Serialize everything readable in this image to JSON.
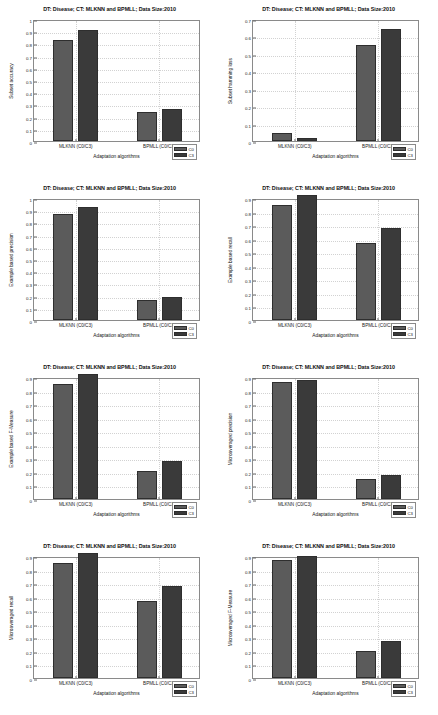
{
  "figure": {
    "shared_title": "DT: Disease; CT: MLKNN and BPMLL; Data Size:2010",
    "xlabel": "Adaptation algorithms",
    "categories": [
      "MLKNN (C0/C3)",
      "BPMLL (C0/C3)"
    ],
    "legend": [
      "C0",
      "C3"
    ],
    "colors": {
      "c0": "#5b5b5b",
      "c3": "#3a3a3a",
      "axis": "#8a8a8a",
      "grid": "#d2d2d2"
    }
  },
  "chart_data": [
    {
      "type": "bar",
      "title": "DT: Disease; CT: MLKNN and BPMLL; Data Size:2010",
      "xlabel": "Adaptation algorithms",
      "ylabel": "Subset accuracy",
      "categories": [
        "MLKNN (C0/C3)",
        "BPMLL (C0/C3)"
      ],
      "series": [
        {
          "name": "C0",
          "values": [
            0.83,
            0.24
          ]
        },
        {
          "name": "C3",
          "values": [
            0.91,
            0.26
          ]
        }
      ],
      "ylim": [
        0,
        1
      ],
      "yticks": [
        0,
        0.1,
        0.2,
        0.3,
        0.4,
        0.5,
        0.6,
        0.7,
        0.8,
        0.9,
        1
      ],
      "ytick_labels": [
        "0",
        "0.1",
        "0.2",
        "0.3",
        "0.4",
        "0.5",
        "0.6",
        "0.7",
        "0.8",
        "0.9",
        "1"
      ],
      "grid": true,
      "legend_position": "bottom-right"
    },
    {
      "type": "bar",
      "title": "DT: Disease; CT: MLKNN and BPMLL; Data Size:2010",
      "xlabel": "Adaptation algorithms",
      "ylabel": "Subset hamming loss",
      "categories": [
        "MLKNN (C0/C3)",
        "BPMLL (C0/C3)"
      ],
      "series": [
        {
          "name": "C0",
          "values": [
            0.045,
            0.55
          ]
        },
        {
          "name": "C3",
          "values": [
            0.015,
            0.64
          ]
        }
      ],
      "ylim": [
        0,
        0.7
      ],
      "yticks": [
        0,
        0.1,
        0.2,
        0.3,
        0.4,
        0.5,
        0.6,
        0.7
      ],
      "ytick_labels": [
        "0",
        "0.1",
        "0.2",
        "0.3",
        "0.4",
        "0.5",
        "0.6",
        "0.7"
      ],
      "grid": true,
      "legend_position": "bottom-right"
    },
    {
      "type": "bar",
      "title": "DT: Disease; CT: MLKNN and BPMLL; Data Size:2010",
      "xlabel": "Adaptation algorithms",
      "ylabel": "Example based precision",
      "categories": [
        "MLKNN (C0/C3)",
        "BPMLL (C0/C3)"
      ],
      "series": [
        {
          "name": "C0",
          "values": [
            0.87,
            0.16
          ]
        },
        {
          "name": "C3",
          "values": [
            0.93,
            0.19
          ]
        }
      ],
      "ylim": [
        0,
        1
      ],
      "yticks": [
        0,
        0.1,
        0.2,
        0.3,
        0.4,
        0.5,
        0.6,
        0.7,
        0.8,
        0.9,
        1
      ],
      "ytick_labels": [
        "0",
        "0.1",
        "0.2",
        "0.3",
        "0.4",
        "0.5",
        "0.6",
        "0.7",
        "0.8",
        "0.9",
        "1"
      ],
      "grid": true,
      "legend_position": "bottom-right"
    },
    {
      "type": "bar",
      "title": "DT: Disease; CT: MLKNN and BPMLL; Data Size:2010",
      "xlabel": "Adaptation algorithms",
      "ylabel": "Example based recall",
      "categories": [
        "MLKNN (C0/C3)",
        "BPMLL (C0/C3)"
      ],
      "series": [
        {
          "name": "C0",
          "values": [
            0.85,
            0.57
          ]
        },
        {
          "name": "C3",
          "values": [
            0.92,
            0.68
          ]
        }
      ],
      "ylim": [
        0,
        0.9
      ],
      "yticks": [
        0,
        0.1,
        0.2,
        0.3,
        0.4,
        0.5,
        0.6,
        0.7,
        0.8,
        0.9
      ],
      "ytick_labels": [
        "0",
        "0.1",
        "0.2",
        "0.3",
        "0.4",
        "0.5",
        "0.6",
        "0.7",
        "0.8",
        "0.9"
      ],
      "grid": true,
      "legend_position": "bottom-right"
    },
    {
      "type": "bar",
      "title": "DT: Disease; CT: MLKNN and BPMLL; Data Size:2010",
      "xlabel": "Adaptation algorithms",
      "ylabel": "Example based F-Measure",
      "categories": [
        "MLKNN (C0/C3)",
        "BPMLL (C0/C3)"
      ],
      "series": [
        {
          "name": "C0",
          "values": [
            0.85,
            0.21
          ]
        },
        {
          "name": "C3",
          "values": [
            0.92,
            0.28
          ]
        }
      ],
      "ylim": [
        0,
        0.9
      ],
      "yticks": [
        0,
        0.1,
        0.2,
        0.3,
        0.4,
        0.5,
        0.6,
        0.7,
        0.8,
        0.9
      ],
      "ytick_labels": [
        "0",
        "0.1",
        "0.2",
        "0.3",
        "0.4",
        "0.5",
        "0.6",
        "0.7",
        "0.8",
        "0.9"
      ],
      "grid": true,
      "legend_position": "bottom-right"
    },
    {
      "type": "bar",
      "title": "DT: Disease; CT: MLKNN and BPMLL; Data Size:2010",
      "xlabel": "Adaptation algorithms",
      "ylabel": "Microaveraged precision",
      "categories": [
        "MLKNN (C0/C3)",
        "BPMLL (C0/C3)"
      ],
      "series": [
        {
          "name": "C0",
          "values": [
            0.86,
            0.15
          ]
        },
        {
          "name": "C3",
          "values": [
            0.88,
            0.18
          ]
        }
      ],
      "ylim": [
        0,
        0.9
      ],
      "yticks": [
        0,
        0.1,
        0.2,
        0.3,
        0.4,
        0.5,
        0.6,
        0.7,
        0.8,
        0.9
      ],
      "ytick_labels": [
        "0",
        "0.1",
        "0.2",
        "0.3",
        "0.4",
        "0.5",
        "0.6",
        "0.7",
        "0.8",
        "0.9"
      ],
      "grid": true,
      "legend_position": "bottom-right"
    },
    {
      "type": "bar",
      "title": "DT: Disease; CT: MLKNN and BPMLL; Data Size:2010",
      "xlabel": "Adaptation algorithms",
      "ylabel": "Microaveraged recall",
      "categories": [
        "MLKNN (C0/C3)",
        "BPMLL (C0/C3)"
      ],
      "series": [
        {
          "name": "C0",
          "values": [
            0.85,
            0.57
          ]
        },
        {
          "name": "C3",
          "values": [
            0.92,
            0.68
          ]
        }
      ],
      "ylim": [
        0,
        0.9
      ],
      "yticks": [
        0,
        0.1,
        0.2,
        0.3,
        0.4,
        0.5,
        0.6,
        0.7,
        0.8,
        0.9
      ],
      "ytick_labels": [
        "0",
        "0.1",
        "0.2",
        "0.3",
        "0.4",
        "0.5",
        "0.6",
        "0.7",
        "0.8",
        "0.9"
      ],
      "grid": true,
      "legend_position": "bottom-right"
    },
    {
      "type": "bar",
      "title": "DT: Disease; CT: MLKNN and BPMLL; Data Size:2010",
      "xlabel": "Adaptation algorithms",
      "ylabel": "Microaveraged F-Measure",
      "categories": [
        "MLKNN (C0/C3)",
        "BPMLL (C0/C3)"
      ],
      "series": [
        {
          "name": "C0",
          "values": [
            0.87,
            0.2
          ]
        },
        {
          "name": "C3",
          "values": [
            0.9,
            0.27
          ]
        }
      ],
      "ylim": [
        0,
        0.9
      ],
      "yticks": [
        0,
        0.1,
        0.2,
        0.3,
        0.4,
        0.5,
        0.6,
        0.7,
        0.8,
        0.9
      ],
      "ytick_labels": [
        "0",
        "0.1",
        "0.2",
        "0.3",
        "0.4",
        "0.5",
        "0.6",
        "0.7",
        "0.8",
        "0.9"
      ],
      "grid": true,
      "legend_position": "bottom-right"
    }
  ]
}
